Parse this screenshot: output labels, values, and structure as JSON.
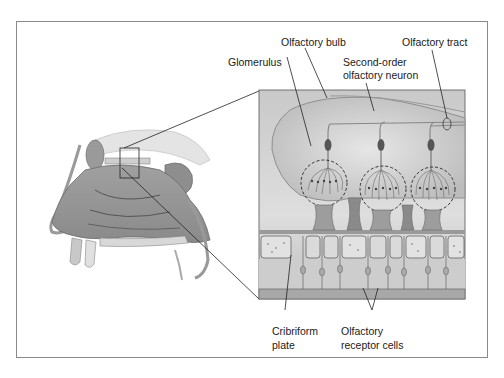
{
  "figure": {
    "left_panel": "Sagittal section of nasal cavity",
    "right_panel": "Enlarged view of olfactory bulb and epithelium"
  },
  "labels": {
    "olfactory_bulb": "Olfactory bulb",
    "olfactory_tract": "Olfactory tract",
    "glomerulus": "Glomerulus",
    "second_order_line1": "Second-order",
    "second_order_line2": "olfactory neuron",
    "cribriform_line1": "Cribriform",
    "cribriform_line2": "plate",
    "receptor_line1": "Olfactory",
    "receptor_line2": "receptor cells"
  },
  "colors": {
    "frame_border": "#8a8a8a",
    "inset_bg": "#d4d4d4",
    "tissue": "#a8a8a8",
    "line": "#2a2a2a"
  }
}
